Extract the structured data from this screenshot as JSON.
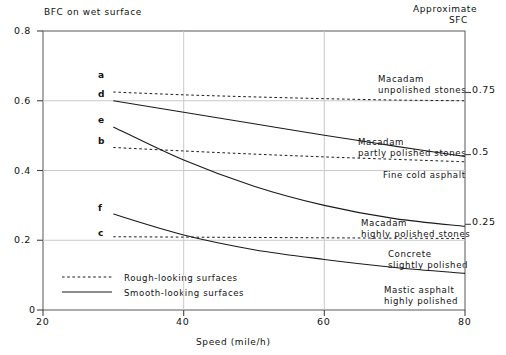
{
  "titles": {
    "y_title": "BFC on wet surface",
    "right_title_line1": "Approximate",
    "right_title_line2": "SFC",
    "x_title": "Speed (mile/h)"
  },
  "axes": {
    "y_ticks": [
      "0.8",
      "0.6",
      "0.4",
      "0.2",
      "0"
    ],
    "x_ticks": [
      "20",
      "40",
      "60",
      "80"
    ],
    "sfc_ticks": [
      "0.75",
      "0.5",
      "0.25"
    ]
  },
  "curve_labels": {
    "a": "a",
    "b": "b",
    "c": "c",
    "d": "d",
    "e": "e",
    "f": "f"
  },
  "surface_labels": [
    {
      "line1": "Macadam",
      "line2": "unpolished stones"
    },
    {
      "line1": "Macadam",
      "line2": "partly polished stones"
    },
    {
      "line1": "Fine cold asphalt",
      "line2": ""
    },
    {
      "line1": "Macadam",
      "line2": "highly polished stones"
    },
    {
      "line1": "Concrete",
      "line2": "slightly polished"
    },
    {
      "line1": "Mastic asphalt",
      "line2": "highly polished"
    }
  ],
  "legend": [
    {
      "label": "Rough-looking surfaces",
      "style": "dashed"
    },
    {
      "label": "Smooth-looking surfaces",
      "style": "solid"
    }
  ],
  "colors": {
    "line": "#1a1a1a",
    "grid": "#bfbfbf",
    "axis": "#555555",
    "text": "#111111"
  },
  "chart_data": {
    "type": "line",
    "xlabel": "Speed (mile/h)",
    "ylabel": "BFC on wet surface",
    "xlim": [
      20,
      80
    ],
    "ylim": [
      0,
      0.8
    ],
    "grid": true,
    "legend_position": "lower-left-inside",
    "secondary_axis": {
      "label": "Approximate SFC",
      "ticks": [
        0.75,
        0.5,
        0.25
      ]
    },
    "series": [
      {
        "name": "a",
        "label": "Macadam unpolished stones",
        "style": "dashed",
        "x": [
          30,
          40,
          50,
          60,
          70,
          80
        ],
        "y": [
          0.625,
          0.617,
          0.611,
          0.606,
          0.602,
          0.6
        ]
      },
      {
        "name": "d",
        "label": "Macadam unpolished stones (smooth-looking)",
        "style": "solid",
        "x": [
          30,
          40,
          50,
          60,
          70,
          80
        ],
        "y": [
          0.6,
          0.567,
          0.534,
          0.501,
          0.47,
          0.44
        ]
      },
      {
        "name": "b",
        "label": "Macadam partly polished stones",
        "style": "dashed",
        "x": [
          30,
          40,
          50,
          60,
          70,
          80
        ],
        "y": [
          0.466,
          0.456,
          0.447,
          0.439,
          0.432,
          0.425
        ]
      },
      {
        "name": "e",
        "label": "Fine cold asphalt",
        "style": "solid",
        "x": [
          30,
          40,
          50,
          60,
          70,
          80
        ],
        "y": [
          0.525,
          0.43,
          0.355,
          0.3,
          0.262,
          0.24
        ]
      },
      {
        "name": "c",
        "label": "Macadam highly polished stones",
        "style": "dashed",
        "x": [
          30,
          40,
          50,
          60,
          70,
          80
        ],
        "y": [
          0.21,
          0.209,
          0.208,
          0.207,
          0.206,
          0.205
        ]
      },
      {
        "name": "f",
        "label": "Mastic asphalt highly polished",
        "style": "solid",
        "x": [
          30,
          40,
          50,
          60,
          70,
          80
        ],
        "y": [
          0.275,
          0.215,
          0.173,
          0.145,
          0.122,
          0.105
        ]
      }
    ]
  }
}
